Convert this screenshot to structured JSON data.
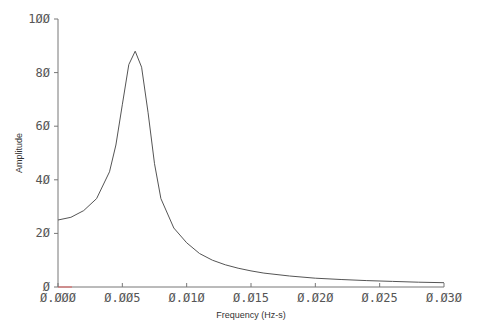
{
  "chart_data": {
    "type": "line",
    "title": "",
    "xlabel": "Frequency (Hz-s)",
    "ylabel": "Amplitude",
    "xlim": [
      0.0,
      0.03
    ],
    "ylim": [
      0,
      100
    ],
    "grid": false,
    "legend": null,
    "x_ticks": [
      "0.000",
      "0.005",
      "0.010",
      "0.015",
      "0.020",
      "0.025",
      "0.030"
    ],
    "y_ticks": [
      "0",
      "20",
      "40",
      "60",
      "80",
      "100"
    ],
    "series": [
      {
        "name": "Amplitude spectrum",
        "color": "#555555",
        "x": [
          0.0,
          0.001,
          0.002,
          0.003,
          0.004,
          0.0045,
          0.005,
          0.0055,
          0.006,
          0.0065,
          0.007,
          0.0075,
          0.008,
          0.009,
          0.01,
          0.011,
          0.012,
          0.013,
          0.014,
          0.015,
          0.016,
          0.018,
          0.02,
          0.022,
          0.024,
          0.026,
          0.028,
          0.03
        ],
        "values": [
          25,
          26,
          28.5,
          33,
          43,
          53,
          68,
          83,
          88,
          82,
          65,
          46,
          33,
          22,
          16.5,
          12.5,
          10,
          8.3,
          7,
          6,
          5.2,
          4.1,
          3.3,
          2.8,
          2.4,
          2.1,
          1.8,
          1.6
        ]
      }
    ]
  }
}
